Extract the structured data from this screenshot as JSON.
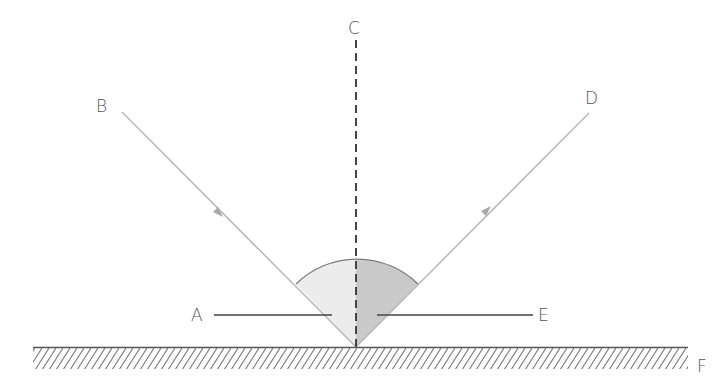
{
  "diagram": {
    "labels": {
      "A": "A",
      "B": "B",
      "C": "C",
      "D": "D",
      "E": "E",
      "F": "F"
    },
    "elements": {
      "A": "angle of incidence (pointer)",
      "B": "incident ray",
      "C": "normal (dashed)",
      "D": "reflected ray",
      "E": "angle of reflection (pointer)",
      "F": "reflecting surface"
    },
    "colors": {
      "ray": "#b8b8b8",
      "normal": "#444444",
      "surface": "#555555",
      "hatch": "#777777",
      "incidence_angle_fill": "#ececec",
      "reflection_angle_fill": "#c9c9c9",
      "arc": "#777777",
      "pointer": "#444444",
      "label": "#555555"
    }
  }
}
